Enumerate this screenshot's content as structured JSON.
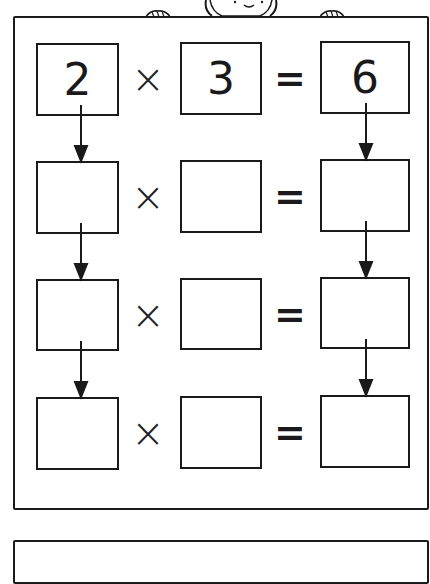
{
  "diagram": {
    "title": "",
    "operators": {
      "times": "×",
      "equals": "="
    },
    "rows": [
      {
        "a": "2",
        "b": "3",
        "result": "6"
      },
      {
        "a": "",
        "b": "",
        "result": ""
      },
      {
        "a": "",
        "b": "",
        "result": ""
      },
      {
        "a": "",
        "b": "",
        "result": ""
      }
    ],
    "arrows": [
      {
        "from": "row1.a",
        "to": "row2.a"
      },
      {
        "from": "row2.a",
        "to": "row3.a"
      },
      {
        "from": "row3.a",
        "to": "row4.a"
      },
      {
        "from": "row1.result",
        "to": "row2.result"
      },
      {
        "from": "row2.result",
        "to": "row3.result"
      },
      {
        "from": "row3.result",
        "to": "row4.result"
      }
    ],
    "decoration": "cartoon-character-peeking-over-top-edge-holding-sign",
    "stroke_color": "#1a1a1a"
  }
}
